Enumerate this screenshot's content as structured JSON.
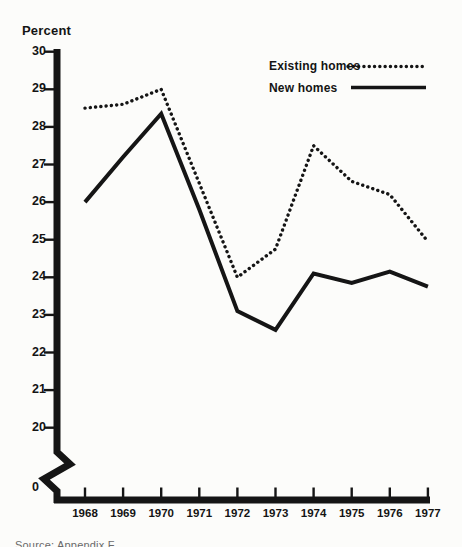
{
  "page": {
    "background": "#fcfcfa",
    "ink_color": "#151515"
  },
  "chart_data": {
    "type": "line",
    "title": "Percent",
    "x": [
      1968,
      1969,
      1970,
      1971,
      1972,
      1973,
      1974,
      1975,
      1976,
      1977
    ],
    "x_axis": {
      "tick_labels": [
        "1968",
        "1969",
        "1970",
        "1971",
        "1972",
        "1973",
        "1974",
        "1975",
        "1976",
        "1977"
      ]
    },
    "y_axis": {
      "unit_label": "Percent",
      "ticks": [
        30,
        29,
        28,
        27,
        26,
        25,
        24,
        23,
        22,
        21,
        20
      ],
      "zero_label": "0",
      "axis_break_between": [
        0,
        20
      ],
      "ylim_displayed": [
        20,
        30
      ],
      "grid": false
    },
    "series": [
      {
        "name": "Existing homes",
        "line_style": "dotted",
        "values": [
          28.5,
          28.6,
          29.0,
          26.5,
          24.0,
          24.75,
          27.5,
          26.55,
          26.2,
          24.95
        ]
      },
      {
        "name": "New homes",
        "line_style": "solid",
        "values": [
          26.0,
          27.2,
          28.35,
          25.8,
          23.1,
          22.6,
          24.1,
          23.85,
          24.15,
          23.75
        ]
      }
    ],
    "legend": {
      "position": "top-right",
      "entries": [
        "Existing homes",
        "New homes"
      ]
    },
    "source_note": "Source: Appendix F"
  }
}
